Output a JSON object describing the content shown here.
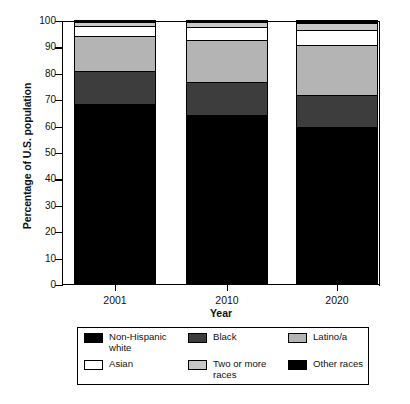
{
  "chart_data": {
    "type": "bar",
    "stacked": true,
    "title": "",
    "xlabel": "Year",
    "ylabel": "Percentage of U.S. population",
    "categories": [
      "2001",
      "2010",
      "2020"
    ],
    "ylim": [
      0,
      100
    ],
    "yticks": [
      0,
      10,
      20,
      30,
      40,
      50,
      60,
      70,
      80,
      90,
      100
    ],
    "ytick_labels": [
      "0",
      "10",
      "20",
      "30",
      "40",
      "50",
      "60",
      "70",
      "80",
      "90",
      "100"
    ],
    "grid": false,
    "legend_position": "below",
    "series": [
      {
        "name": "Non-Hispanic white",
        "color": "#000000",
        "values": [
          68.3,
          64.1,
          59.3
        ]
      },
      {
        "name": "Black",
        "color": "#3d3d3d",
        "values": [
          12.3,
          12.4,
          12.2
        ]
      },
      {
        "name": "Latino/a",
        "color": "#b4b4b4",
        "values": [
          13.2,
          16.1,
          18.9
        ]
      },
      {
        "name": "Asian",
        "color": "#ffffff",
        "values": [
          3.8,
          4.8,
          5.8
        ]
      },
      {
        "name": "Two or more races",
        "color": "#c8c8c8",
        "values": [
          1.5,
          1.9,
          2.6
        ]
      },
      {
        "name": "Other races",
        "color": "#000000",
        "values": [
          0.9,
          0.7,
          1.2
        ]
      }
    ]
  },
  "axes": {
    "y_title": "Percentage of U.S. population",
    "x_title": "Year"
  },
  "legend": {
    "entries": [
      {
        "label": "Non-Hispanic\nwhite",
        "color": "#000000"
      },
      {
        "label": "Black",
        "color": "#3d3d3d"
      },
      {
        "label": "Latino/a",
        "color": "#b4b4b4"
      },
      {
        "label": "Asian",
        "color": "#ffffff"
      },
      {
        "label": "Two or more\nraces",
        "color": "#c8c8c8"
      },
      {
        "label": "Other races",
        "color": "#000000"
      }
    ]
  }
}
